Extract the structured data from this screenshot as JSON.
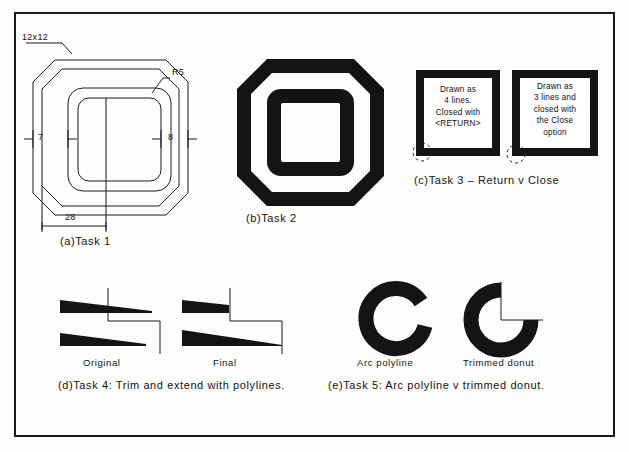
{
  "drawing": {
    "title": "AutoCAD exercise sheet - polyline tasks",
    "line_color": "#1b1b1b",
    "fill_color": "#141414",
    "background": "#fdfdfb"
  },
  "figures": {
    "task1": {
      "caption": "(a)Task 1",
      "dimensions": {
        "chamfer": "12x12",
        "radius": "R5",
        "left_offset": "7",
        "right_offset": "8",
        "width": "28"
      }
    },
    "task2": {
      "caption": "(b)Task 2"
    },
    "task3": {
      "caption": "(c)Task 3 – Return v Close",
      "box_left": {
        "line1": "Drawn as",
        "line2": "4 lines.",
        "line3": "Closed with",
        "line4": "<RETURN>"
      },
      "box_right": {
        "line1": "Drawn as",
        "line2": "3 lines and",
        "line3": "closed with",
        "line4": "the Close",
        "line5": "option"
      }
    },
    "task4": {
      "caption": "(d)Task 4: Trim and extend with polylines.",
      "label_left": "Original",
      "label_right": "Final"
    },
    "task5": {
      "caption": "(e)Task 5: Arc polyline v trimmed donut.",
      "label_left": "Arc polyline",
      "label_right": "Trimmed donut"
    }
  }
}
